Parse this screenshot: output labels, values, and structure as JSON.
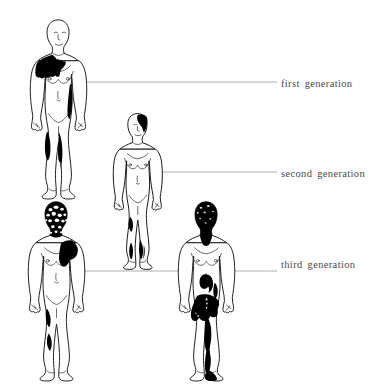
{
  "diagram": {
    "title": "",
    "background_color": "#ffffff",
    "outline_color": "#1a1a1a",
    "patch_color": "#000000",
    "leader_line_color": "#9a9a9a",
    "label_color": "#4a4a4a"
  },
  "labels": [
    {
      "id": "first",
      "text": "first generation",
      "leader_from_x": 78,
      "leader_to_x": 277,
      "leader_y": 82
    },
    {
      "id": "second",
      "text": "second generation",
      "leader_from_x": 152,
      "leader_to_x": 277,
      "leader_y": 172
    },
    {
      "id": "third",
      "text": "third generation",
      "leader_from_x": 64,
      "leader_to_x": 277,
      "leader_y": 271
    }
  ],
  "figures": [
    {
      "id": "figure-first-generation",
      "name": "first-generation-body",
      "generation": "first generation",
      "position": {
        "x": 30,
        "y": 18
      },
      "affected_regions": [
        "left shoulder",
        "left upper chest",
        "right upper arm",
        "right forearm",
        "left knee",
        "right shin"
      ]
    },
    {
      "id": "figure-second-generation",
      "name": "second-generation-body",
      "generation": "second generation",
      "position": {
        "x": 113,
        "y": 112
      },
      "affected_regions": [
        "scalp right side",
        "left thigh",
        "left calf",
        "right calf"
      ]
    },
    {
      "id": "figure-third-generation-left",
      "name": "third-generation-body-left",
      "generation": "third generation",
      "position": {
        "x": 28,
        "y": 200
      },
      "affected_regions": [
        "head and face (mottled)",
        "right shoulder and upper chest",
        "left hip",
        "left thigh"
      ]
    },
    {
      "id": "figure-third-generation-right",
      "name": "third-generation-body-right",
      "generation": "third generation",
      "position": {
        "x": 178,
        "y": 200
      },
      "affected_regions": [
        "head, face and neck",
        "upper abdomen",
        "left flank",
        "pelvis and groin",
        "right thigh",
        "right shin",
        "right foot"
      ]
    }
  ]
}
